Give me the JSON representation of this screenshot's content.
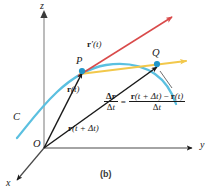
{
  "figure": {
    "caption": "(b)",
    "axes": {
      "z_label": "z",
      "y_label": "y",
      "x_label": "x",
      "origin_label": "O"
    },
    "curve": {
      "label": "C",
      "color": "#5bc0e0"
    },
    "points": {
      "p_label": "P",
      "q_label": "Q",
      "dot_color": "#2196c9"
    },
    "vectors": {
      "r_t": {
        "bold": "r",
        "arg": "(t)",
        "color": "#1a1a1a"
      },
      "r_t_dt": {
        "bold": "r",
        "arg": "(t + Δt)",
        "color": "#1a1a1a"
      },
      "r_prime": {
        "bold": "r",
        "arg": "′(t)",
        "color": "#d94a4a"
      },
      "secant_color": "#f2c84b"
    },
    "equation": {
      "lhs_numerator": "Δr",
      "lhs_denominator": "Δt",
      "equals": "=",
      "rhs_numerator": "r(t + Δt) − r(t)",
      "rhs_denominator": "Δt",
      "lhs_num_bold": "Δ",
      "lhs_num_vec": "r",
      "lhs_den_delta": "Δ",
      "lhs_den_var": "t",
      "rhs_num_v1": "r",
      "rhs_num_a1": "(t + Δt)",
      "rhs_num_minus": "−",
      "rhs_num_v2": "r",
      "rhs_num_a2": "(t)",
      "rhs_den_delta": "Δ",
      "rhs_den_var": "t"
    }
  }
}
